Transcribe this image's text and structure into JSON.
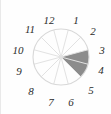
{
  "figure": {
    "name": "clock-face-sector-diagram",
    "type": "clock-dial",
    "background_color": "#fefefe",
    "border_color": "#e9e9e9"
  },
  "dial": {
    "center_x": 60,
    "center_y": 57,
    "radius": 28,
    "outline_color": "#d8d8d8",
    "spoke_color": "#e2e2e2",
    "sector_count": 12
  },
  "hours": [
    {
      "label": "1",
      "angle_deg": 30,
      "x": 75,
      "y": 21
    },
    {
      "label": "2",
      "angle_deg": 60,
      "x": 92,
      "y": 32
    },
    {
      "label": "3",
      "angle_deg": 90,
      "x": 101,
      "y": 51
    },
    {
      "label": "4",
      "angle_deg": 120,
      "x": 100,
      "y": 71
    },
    {
      "label": "5",
      "angle_deg": 150,
      "x": 90,
      "y": 91
    },
    {
      "label": "6",
      "angle_deg": 180,
      "x": 70,
      "y": 103
    },
    {
      "label": "7",
      "angle_deg": 210,
      "x": 50,
      "y": 103
    },
    {
      "label": "8",
      "angle_deg": 240,
      "x": 30,
      "y": 92
    },
    {
      "label": "9",
      "angle_deg": 270,
      "x": 18,
      "y": 72
    },
    {
      "label": "10",
      "angle_deg": 300,
      "x": 17,
      "y": 51
    },
    {
      "label": "11",
      "angle_deg": 330,
      "x": 29,
      "y": 30
    },
    {
      "label": "12",
      "angle_deg": 0,
      "x": 48,
      "y": 21
    }
  ],
  "shaded_sector": {
    "name": "shaded-wedge",
    "fill_color": "#8c8c8c",
    "start_hour": "2:30",
    "end_hour": "4:30",
    "start_angle_deg": 75,
    "end_angle_deg": 135,
    "covers_hours": [
      "3",
      "4"
    ],
    "span_hours": 2
  },
  "chart_data": {
    "type": "pie",
    "title": "",
    "categories": [
      "1",
      "2",
      "3",
      "4",
      "5",
      "6",
      "7",
      "8",
      "9",
      "10",
      "11",
      "12"
    ],
    "values": [
      1,
      1,
      1,
      1,
      1,
      1,
      1,
      1,
      1,
      1,
      1,
      1
    ],
    "highlighted": [
      "3",
      "4"
    ],
    "highlight_color": "#8c8c8c",
    "base_color": "#ffffff",
    "legend": "none",
    "grid": false
  }
}
